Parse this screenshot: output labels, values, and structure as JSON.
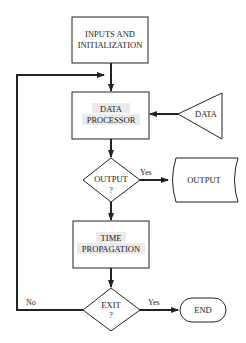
{
  "diagram": {
    "type": "flowchart",
    "nodes": [
      {
        "id": "inputs",
        "shape": "rectangle",
        "lines": [
          "INPUTS AND",
          "INITIALIZATION"
        ],
        "hatched": false
      },
      {
        "id": "processor",
        "shape": "rectangle",
        "lines": [
          "DATA",
          "PROCESSOR"
        ],
        "hatched": true
      },
      {
        "id": "data",
        "shape": "triangle",
        "lines": [
          "DATA"
        ]
      },
      {
        "id": "output_q",
        "shape": "diamond",
        "lines": [
          "OUTPUT",
          "?"
        ]
      },
      {
        "id": "output",
        "shape": "document",
        "lines": [
          "OUTPUT"
        ]
      },
      {
        "id": "time",
        "shape": "rectangle",
        "lines": [
          "TIME",
          "PROPAGATION"
        ],
        "hatched": true
      },
      {
        "id": "exit_q",
        "shape": "diamond",
        "lines": [
          "EXIT",
          "?"
        ]
      },
      {
        "id": "end",
        "shape": "terminator",
        "lines": [
          "END"
        ]
      }
    ],
    "edges": [
      {
        "from": "inputs",
        "to": "processor",
        "label": ""
      },
      {
        "from": "data",
        "to": "processor",
        "label": ""
      },
      {
        "from": "processor",
        "to": "output_q",
        "label": ""
      },
      {
        "from": "output_q",
        "to": "output",
        "label": "Yes"
      },
      {
        "from": "output_q",
        "to": "time",
        "label": ""
      },
      {
        "from": "time",
        "to": "exit_q",
        "label": ""
      },
      {
        "from": "exit_q",
        "to": "end",
        "label": "Yes"
      },
      {
        "from": "exit_q",
        "to": "processor",
        "label": "No"
      }
    ],
    "labels": {
      "inputs_l1": "INPUTS AND",
      "inputs_l2": "INITIALIZATION",
      "processor_l1": "DATA",
      "processor_l2": "PROCESSOR",
      "data": "DATA",
      "output_q_l1": "OUTPUT",
      "output_q_l2": "?",
      "output_yes": "Yes",
      "output": "OUTPUT",
      "time_l1": "TIME",
      "time_l2": "PROPAGATION",
      "exit_q_l1": "EXIT",
      "exit_q_l2": "?",
      "exit_yes": "Yes",
      "exit_no": "No",
      "end": "END"
    },
    "colors": {
      "line": "#222222",
      "hatch_bg": "#e6e6e6",
      "hatch_line": "#888888",
      "background": "#ffffff"
    }
  }
}
